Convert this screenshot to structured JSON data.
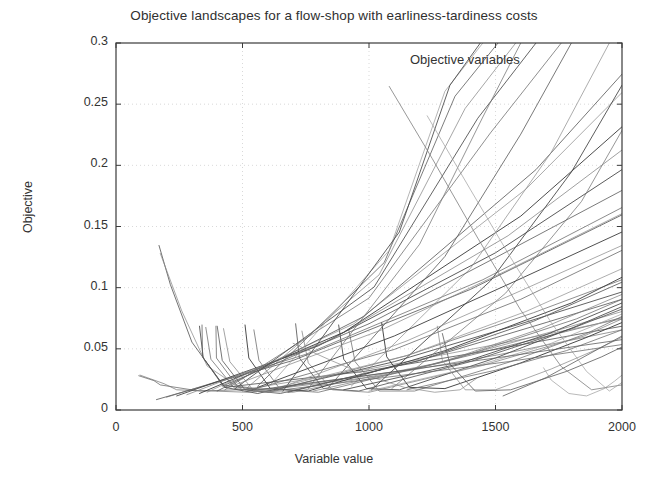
{
  "chart_data": {
    "type": "line",
    "title": "Objective landscapes for a flow-shop with earliness-tardiness costs",
    "xlabel": "Variable value",
    "ylabel": "Objective",
    "legend": "Objective variables",
    "legend_position": "top-center-right",
    "grid": true,
    "grid_style": "dotted",
    "xlim": [
      0,
      2000
    ],
    "ylim": [
      0,
      0.3
    ],
    "xticks": [
      0,
      500,
      1000,
      1500,
      2000
    ],
    "xtick_labels": [
      "0",
      "500",
      "1000",
      "1500",
      "2000"
    ],
    "yticks": [
      0,
      0.05,
      0.1,
      0.15,
      0.2,
      0.25,
      0.3
    ],
    "ytick_labels": [
      "0",
      "0.05",
      "0.1",
      "0.15",
      "0.2",
      "0.25",
      "0.3"
    ],
    "series": [
      {
        "name": "var-01",
        "color": "#6a6a6a",
        "width": 0.85,
        "x": [
          90,
          150,
          175,
          330,
          620,
          1180,
          2000
        ],
        "y": [
          0.028,
          0.024,
          0.0205,
          0.0155,
          0.0175,
          0.0335,
          0.0755
        ]
      },
      {
        "name": "var-02",
        "color": "#777777",
        "width": 0.8,
        "x": [
          95,
          190,
          240,
          520,
          1030,
          1520,
          2000
        ],
        "y": [
          0.0285,
          0.0215,
          0.0165,
          0.0145,
          0.0275,
          0.0455,
          0.0655
        ]
      },
      {
        "name": "var-03",
        "color": "#555555",
        "width": 0.9,
        "x": [
          170,
          215,
          300,
          430,
          980,
          1500,
          2000
        ],
        "y": [
          0.1345,
          0.1025,
          0.0555,
          0.0185,
          0.0315,
          0.0495,
          0.0685
        ]
      },
      {
        "name": "var-04",
        "color": "#8a8a8a",
        "width": 0.8,
        "x": [
          175,
          260,
          360,
          500,
          1000,
          1550,
          2000
        ],
        "y": [
          0.128,
          0.081,
          0.036,
          0.0165,
          0.0335,
          0.0555,
          0.0745
        ]
      },
      {
        "name": "var-05",
        "color": "#4d4d4d",
        "width": 0.95,
        "x": [
          330,
          345,
          430,
          560,
          1100,
          1600,
          2000
        ],
        "y": [
          0.0685,
          0.0425,
          0.0185,
          0.0135,
          0.0395,
          0.0705,
          0.0965
        ]
      },
      {
        "name": "var-06",
        "color": "#6f6f6f",
        "width": 0.85,
        "x": [
          355,
          375,
          470,
          600,
          1150,
          1650,
          2000
        ],
        "y": [
          0.0675,
          0.0415,
          0.0175,
          0.0145,
          0.0445,
          0.0795,
          0.1065
        ]
      },
      {
        "name": "var-07",
        "color": "#5a5a5a",
        "width": 0.9,
        "x": [
          400,
          420,
          510,
          650,
          1200,
          1700,
          2000
        ],
        "y": [
          0.0685,
          0.0405,
          0.0165,
          0.0135,
          0.0405,
          0.0715,
          0.0905
        ]
      },
      {
        "name": "var-08",
        "color": "#828282",
        "width": 0.8,
        "x": [
          425,
          450,
          545,
          700,
          1250,
          1750,
          2000
        ],
        "y": [
          0.0665,
          0.0395,
          0.0155,
          0.0145,
          0.0375,
          0.0655,
          0.0805
        ]
      },
      {
        "name": "var-09",
        "color": "#3f3f3f",
        "width": 1.0,
        "x": [
          510,
          525,
          610,
          760,
          1300,
          1800,
          2000
        ],
        "y": [
          0.0695,
          0.0425,
          0.0175,
          0.0155,
          0.0485,
          0.0875,
          0.1085
        ]
      },
      {
        "name": "var-10",
        "color": "#6d6d6d",
        "width": 0.85,
        "x": [
          545,
          565,
          650,
          800,
          1350,
          1820,
          2000
        ],
        "y": [
          0.0655,
          0.0405,
          0.0165,
          0.0145,
          0.0425,
          0.0745,
          0.0905
        ]
      },
      {
        "name": "var-11",
        "color": "#525252",
        "width": 0.9,
        "x": [
          710,
          725,
          820,
          960,
          1400,
          1800,
          2000
        ],
        "y": [
          0.0705,
          0.0425,
          0.0175,
          0.0155,
          0.0395,
          0.0665,
          0.0825
        ]
      },
      {
        "name": "var-12",
        "color": "#7d7d7d",
        "width": 0.8,
        "x": [
          735,
          760,
          855,
          1000,
          1450,
          1850,
          2000
        ],
        "y": [
          0.0645,
          0.0385,
          0.0165,
          0.0145,
          0.0365,
          0.0605,
          0.0745
        ]
      },
      {
        "name": "var-13",
        "color": "#4a4a4a",
        "width": 0.95,
        "x": [
          880,
          900,
          990,
          1120,
          1500,
          1820,
          2000
        ],
        "y": [
          0.0695,
          0.0415,
          0.0175,
          0.0165,
          0.0425,
          0.0685,
          0.0845
        ]
      },
      {
        "name": "var-14",
        "color": "#717171",
        "width": 0.85,
        "x": [
          920,
          945,
          1040,
          1180,
          1560,
          1860,
          2000
        ],
        "y": [
          0.0655,
          0.0395,
          0.0155,
          0.0155,
          0.0395,
          0.0625,
          0.0765
        ]
      },
      {
        "name": "var-15",
        "color": "#3b3b3b",
        "width": 1.0,
        "x": [
          1050,
          1070,
          1160,
          1300,
          1600,
          1850,
          2000
        ],
        "y": [
          0.0715,
          0.0435,
          0.0185,
          0.0175,
          0.0385,
          0.0585,
          0.0715
        ]
      },
      {
        "name": "var-16",
        "color": "#888888",
        "width": 0.8,
        "x": [
          1270,
          1290,
          1380,
          1500,
          1720,
          1900,
          2000
        ],
        "y": [
          0.0685,
          0.0405,
          0.0165,
          0.0165,
          0.0335,
          0.0495,
          0.0595
        ]
      },
      {
        "name": "var-17",
        "color": "#5e5e5e",
        "width": 0.9,
        "x": [
          1290,
          1320,
          1420,
          1560,
          1780,
          1920,
          2000
        ],
        "y": [
          0.0625,
          0.0375,
          0.0155,
          0.0165,
          0.0315,
          0.0435,
          0.0515
        ]
      },
      {
        "name": "var-18",
        "color": "#9a9a9a",
        "width": 0.75,
        "x": [
          1690,
          1720,
          1790,
          1860,
          1930,
          1970,
          2000
        ],
        "y": [
          0.0345,
          0.0245,
          0.0135,
          0.0115,
          0.0175,
          0.0235,
          0.0285
        ]
      },
      {
        "name": "ramp-01",
        "color": "#575757",
        "width": 0.9,
        "x": [
          160,
          700,
          1400,
          2000
        ],
        "y": [
          0.0085,
          0.0405,
          0.0985,
          0.1595
        ]
      },
      {
        "name": "ramp-02",
        "color": "#6b6b6b",
        "width": 0.85,
        "x": [
          200,
          750,
          1450,
          2000
        ],
        "y": [
          0.0105,
          0.0455,
          0.1065,
          0.1655
        ]
      },
      {
        "name": "ramp-03",
        "color": "#444444",
        "width": 0.95,
        "x": [
          240,
          800,
          1500,
          2000
        ],
        "y": [
          0.0115,
          0.0525,
          0.1285,
          0.1965
        ]
      },
      {
        "name": "ramp-04",
        "color": "#7e7e7e",
        "width": 0.8,
        "x": [
          280,
          850,
          1550,
          2000
        ],
        "y": [
          0.0125,
          0.0575,
          0.1425,
          0.2125
        ]
      },
      {
        "name": "ramp-05",
        "color": "#3d3d3d",
        "width": 1.0,
        "x": [
          330,
          900,
          1600,
          2000
        ],
        "y": [
          0.0135,
          0.0635,
          0.1585,
          0.2315
        ]
      },
      {
        "name": "ramp-06",
        "color": "#8d8d8d",
        "width": 0.8,
        "x": [
          360,
          940,
          1620,
          2000
        ],
        "y": [
          0.0145,
          0.0705,
          0.1805,
          0.2595
        ]
      },
      {
        "name": "ramp-07",
        "color": "#5b5b5b",
        "width": 0.9,
        "x": [
          400,
          980,
          1660,
          2000
        ],
        "y": [
          0.0155,
          0.0765,
          0.1965,
          0.2745
        ]
      },
      {
        "name": "ramp-08",
        "color": "#707070",
        "width": 0.85,
        "x": [
          430,
          1000,
          1480,
          1760
        ],
        "y": [
          0.0165,
          0.0915,
          0.2265,
          0.3
        ]
      },
      {
        "name": "ramp-09",
        "color": "#4f4f4f",
        "width": 0.95,
        "x": [
          470,
          1020,
          1430,
          1660
        ],
        "y": [
          0.0175,
          0.1005,
          0.2385,
          0.3
        ]
      },
      {
        "name": "ramp-10",
        "color": "#868686",
        "width": 0.8,
        "x": [
          520,
          1040,
          1380,
          1580
        ],
        "y": [
          0.0185,
          0.1105,
          0.2465,
          0.3
        ]
      },
      {
        "name": "ramp-11",
        "color": "#626262",
        "width": 0.9,
        "x": [
          560,
          1060,
          1340,
          1510
        ],
        "y": [
          0.0195,
          0.1205,
          0.2565,
          0.3
        ]
      },
      {
        "name": "ramp-12",
        "color": "#959595",
        "width": 0.75,
        "x": [
          610,
          1080,
          1300,
          1450
        ],
        "y": [
          0.0205,
          0.1305,
          0.2605,
          0.3
        ]
      },
      {
        "name": "ramp-13",
        "color": "#4b4b4b",
        "width": 0.95,
        "x": [
          660,
          1120,
          1320,
          1440
        ],
        "y": [
          0.0155,
          0.1455,
          0.2655,
          0.3
        ]
      },
      {
        "name": "ramp-14",
        "color": "#787878",
        "width": 0.85,
        "x": [
          760,
          1200,
          1450,
          1600
        ],
        "y": [
          0.0175,
          0.1355,
          0.2395,
          0.3
        ]
      },
      {
        "name": "ramp-15",
        "color": "#5d5d5d",
        "width": 0.9,
        "x": [
          840,
          1300,
          1600,
          1800
        ],
        "y": [
          0.0185,
          0.1255,
          0.2255,
          0.3
        ]
      },
      {
        "name": "ramp-16",
        "color": "#8f8f8f",
        "width": 0.8,
        "x": [
          930,
          1400,
          1720,
          1950
        ],
        "y": [
          0.0195,
          0.1155,
          0.2105,
          0.3
        ]
      },
      {
        "name": "ramp-17",
        "color": "#464646",
        "width": 0.95,
        "x": [
          1010,
          1480,
          1800,
          2000
        ],
        "y": [
          0.0165,
          0.1055,
          0.1945,
          0.2655
        ]
      },
      {
        "name": "ramp-18",
        "color": "#7a7a7a",
        "width": 0.85,
        "x": [
          1090,
          1540,
          1840,
          2000
        ],
        "y": [
          0.0175,
          0.0955,
          0.1705,
          0.2285
        ]
      },
      {
        "name": "ramp-19",
        "color": "#666666",
        "width": 0.85,
        "x": [
          520,
          1100,
          1600,
          2000
        ],
        "y": [
          0.0155,
          0.0495,
          0.0905,
          0.1305
        ]
      },
      {
        "name": "ramp-20",
        "color": "#909090",
        "width": 0.8,
        "x": [
          600,
          1150,
          1620,
          2000
        ],
        "y": [
          0.0165,
          0.0445,
          0.0805,
          0.1155
        ]
      },
      {
        "name": "ramp-21",
        "color": "#545454",
        "width": 0.9,
        "x": [
          680,
          1200,
          1650,
          2000
        ],
        "y": [
          0.0145,
          0.0405,
          0.0725,
          0.1045
        ]
      },
      {
        "name": "ramp-22",
        "color": "#7c7c7c",
        "width": 0.8,
        "x": [
          780,
          1280,
          1680,
          2000
        ],
        "y": [
          0.0155,
          0.0385,
          0.0665,
          0.0945
        ]
      },
      {
        "name": "ramp-23",
        "color": "#494949",
        "width": 0.95,
        "x": [
          900,
          1350,
          1700,
          2000
        ],
        "y": [
          0.0165,
          0.0375,
          0.0615,
          0.0875
        ]
      },
      {
        "name": "ramp-24",
        "color": "#999999",
        "width": 0.75,
        "x": [
          1000,
          1400,
          1720,
          2000
        ],
        "y": [
          0.0155,
          0.0345,
          0.0545,
          0.0785
        ]
      },
      {
        "name": "ramp-25",
        "color": "#6e6e6e",
        "width": 0.85,
        "x": [
          1150,
          1500,
          1780,
          2000
        ],
        "y": [
          0.0165,
          0.0325,
          0.0485,
          0.0655
        ]
      },
      {
        "name": "ramp-26",
        "color": "#5f5f5f",
        "width": 0.9,
        "x": [
          420,
          1000,
          1500,
          2000
        ],
        "y": [
          0.0195,
          0.0705,
          0.1245,
          0.1795
        ]
      },
      {
        "name": "ramp-27",
        "color": "#858585",
        "width": 0.8,
        "x": [
          470,
          1050,
          1550,
          2000
        ],
        "y": [
          0.0205,
          0.0655,
          0.1145,
          0.1605
        ]
      },
      {
        "name": "ramp-28",
        "color": "#414141",
        "width": 1.0,
        "x": [
          560,
          1100,
          1580,
          2000
        ],
        "y": [
          0.0185,
          0.0605,
          0.1055,
          0.1455
        ]
      },
      {
        "name": "ramp-29",
        "color": "#8b8b8b",
        "width": 0.8,
        "x": [
          640,
          1150,
          1600,
          2000
        ],
        "y": [
          0.0175,
          0.0565,
          0.0975,
          0.1345
        ]
      },
      {
        "name": "ramp-30",
        "color": "#636363",
        "width": 0.9,
        "x": [
          1530,
          1700,
          1850,
          2000
        ],
        "y": [
          0.0115,
          0.0265,
          0.0435,
          0.0605
        ]
      },
      {
        "name": "descend-01",
        "color": "#7b7b7b",
        "width": 0.85,
        "x": [
          1080,
          1250,
          1430,
          1600,
          1760,
          1880,
          2000
        ],
        "y": [
          0.2645,
          0.2055,
          0.1405,
          0.0815,
          0.0355,
          0.0165,
          0.0205
        ]
      },
      {
        "name": "descend-02",
        "color": "#9c9c9c",
        "width": 0.75,
        "x": [
          1230,
          1400,
          1560,
          1720,
          1860,
          1950,
          2000
        ],
        "y": [
          0.2405,
          0.1805,
          0.1245,
          0.0715,
          0.0315,
          0.0155,
          0.0225
        ]
      },
      {
        "name": "descend-03",
        "color": "#8c8c8c",
        "width": 0.8,
        "x": [
          700,
          850,
          1000,
          1140,
          1260,
          1360,
          1430
        ],
        "y": [
          0.0545,
          0.0405,
          0.0275,
          0.0185,
          0.0145,
          0.0165,
          0.0265
        ]
      },
      {
        "name": "spike-01",
        "color": "#5c5c5c",
        "width": 0.85,
        "x": [
          340,
          342,
          420,
          560,
          1000,
          1500,
          2000
        ],
        "y": [
          0.0695,
          0.0435,
          0.0205,
          0.0165,
          0.0285,
          0.0425,
          0.0575
        ]
      },
      {
        "name": "spike-02",
        "color": "#696969",
        "width": 0.85,
        "x": [
          395,
          397,
          480,
          620,
          1060,
          1550,
          2000
        ],
        "y": [
          0.0685,
          0.0425,
          0.0195,
          0.0155,
          0.0265,
          0.0395,
          0.0535
        ]
      }
    ]
  },
  "axes": {
    "title_id": "chart-title",
    "plot_rect": {
      "left": 116,
      "top": 43,
      "right": 622,
      "bottom": 410
    }
  }
}
